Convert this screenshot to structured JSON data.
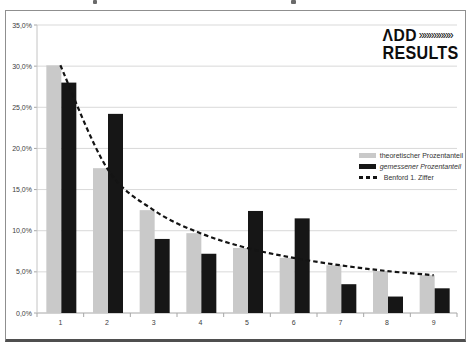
{
  "logo": {
    "line1": "ΛDD",
    "chevrons": "»»»»»»»",
    "line2": "RESULTS"
  },
  "chart_data": {
    "type": "bar",
    "title": "",
    "xlabel": "",
    "ylabel": "",
    "categories": [
      "1",
      "2",
      "3",
      "4",
      "5",
      "6",
      "7",
      "8",
      "9"
    ],
    "series": [
      {
        "name": "theoretischer Prozentanteil",
        "kind": "bar",
        "color": "#c9c9c9",
        "values": [
          30.1,
          17.6,
          12.5,
          9.7,
          7.9,
          6.7,
          5.8,
          5.1,
          4.6
        ]
      },
      {
        "name": "gemessener Prozentanteil",
        "kind": "bar",
        "color": "#161616",
        "values": [
          28.0,
          24.2,
          9.0,
          7.2,
          12.4,
          11.5,
          3.5,
          2.0,
          3.0
        ]
      },
      {
        "name": "Benford 1. Ziffer",
        "kind": "line",
        "style": "dashed",
        "color": "#141414",
        "values": [
          30.1,
          17.6,
          12.5,
          9.7,
          7.9,
          6.7,
          5.8,
          5.1,
          4.6
        ]
      }
    ],
    "ylim": [
      0,
      35
    ],
    "ytick_step": 5,
    "ytick_labels": [
      "0,0%",
      "5,0%",
      "10,0%",
      "15,0%",
      "20,0%",
      "25,0%",
      "30,0%",
      "35,0%"
    ],
    "grid": true,
    "legend_position": "right",
    "colors": {
      "gridline": "#d9d9d9",
      "axis": "#a6a6a6",
      "tick_text": "#404040"
    }
  }
}
